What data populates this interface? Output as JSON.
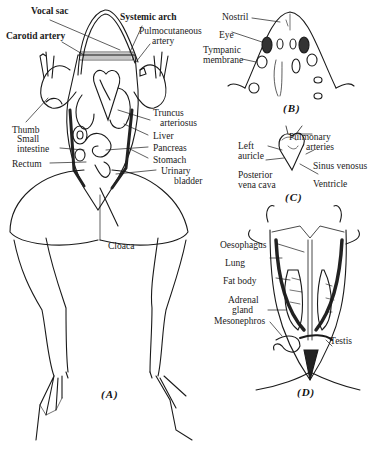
{
  "figure": {
    "panels": [
      {
        "id": "A",
        "caption": "(A)"
      },
      {
        "id": "B",
        "caption": "(B)"
      },
      {
        "id": "C",
        "caption": "(C)"
      },
      {
        "id": "D",
        "caption": "(D)"
      }
    ],
    "labels": {
      "A": {
        "vocal_sac": "Vocal sac",
        "systemic_arch": "Systemic arch",
        "carotid_artery": "Carotid artery",
        "pulmocutaneous_1": "Pulmocutaneous",
        "pulmocutaneous_2": "artery",
        "thumb": "Thumb",
        "truncus_1": "Truncus",
        "truncus_2": "arteriosus",
        "small_intestine_1": "Small",
        "small_intestine_2": "intestine",
        "liver": "Liver",
        "pancreas": "Pancreas",
        "rectum": "Rectum",
        "stomach": "Stomach",
        "urinary_bladder_1": "Urinary",
        "urinary_bladder_2": "bladder",
        "cloaca": "Cloaca"
      },
      "B": {
        "nostril": "Nostril",
        "eye": "Eye",
        "tympanic_1": "Tympanic",
        "tympanic_2": "membrane"
      },
      "C": {
        "left_auricle_1": "Left",
        "left_auricle_2": "auricle",
        "pulmonary_1": "Pulmonary",
        "pulmonary_2": "arteries",
        "sinus_venosus": "Sinus venosus",
        "posterior_vc_1": "Posterior",
        "posterior_vc_2": "vena cava",
        "ventricle": "Ventricle"
      },
      "D": {
        "oesophagus": "Oesophagus",
        "lung": "Lung",
        "fat_body": "Fat body",
        "adrenal_1": "Adrenal",
        "adrenal_2": "gland",
        "mesonephros": "Mesonephros",
        "testis": "Testis"
      }
    },
    "colors": {
      "ink": "#1a1a1a",
      "paper": "#ffffff"
    }
  }
}
